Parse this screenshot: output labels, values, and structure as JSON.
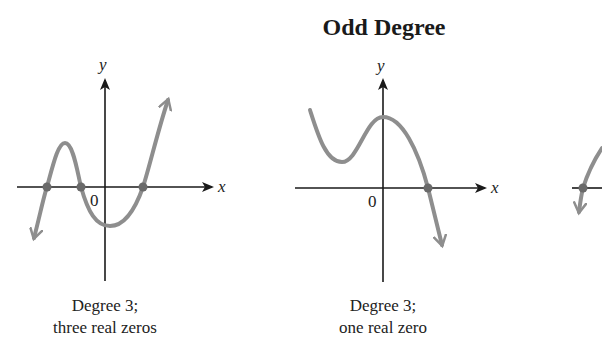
{
  "section_title": "Odd Degree",
  "colors": {
    "curve": "#8e8e8e",
    "axis": "#1a1a1a",
    "zero_point": "#6a6a6a",
    "background": "#ffffff"
  },
  "graphs": [
    {
      "id": "graph-1",
      "x_label": "x",
      "y_label": "y",
      "origin_label": "0",
      "caption_line1": "Degree 3;",
      "caption_line2": "three real zeros",
      "zeros_count": 3
    },
    {
      "id": "graph-2",
      "x_label": "x",
      "y_label": "y",
      "origin_label": "0",
      "caption_line1": "Degree 3;",
      "caption_line2": "one real zero",
      "zeros_count": 1
    },
    {
      "id": "graph-3-partial",
      "zeros_count": 1
    }
  ]
}
